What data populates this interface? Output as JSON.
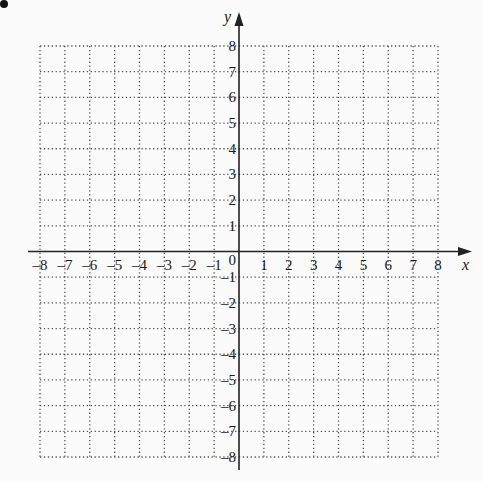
{
  "problem_marker": "•",
  "axes": {
    "x_label": "x",
    "y_label": "y",
    "origin_label": "0",
    "x_min": -8,
    "x_max": 8,
    "y_min": -8,
    "y_max": 8,
    "x_ticks": [
      "-8",
      "-7",
      "-6",
      "-5",
      "-4",
      "-3",
      "-2",
      "-1",
      "1",
      "2",
      "3",
      "4",
      "5",
      "6",
      "7",
      "8"
    ],
    "y_ticks": [
      "8",
      "7",
      "6",
      "5",
      "4",
      "3",
      "2",
      "1",
      "-1",
      "-2",
      "-3",
      "-4",
      "-5",
      "-6",
      "-7",
      "-8"
    ]
  },
  "grid": {
    "style": "dotted",
    "color": "#555555"
  },
  "layout": {
    "left": 40,
    "right": 438,
    "top": 46,
    "bottom": 457,
    "origin_x": 238,
    "origin_y": 251
  }
}
